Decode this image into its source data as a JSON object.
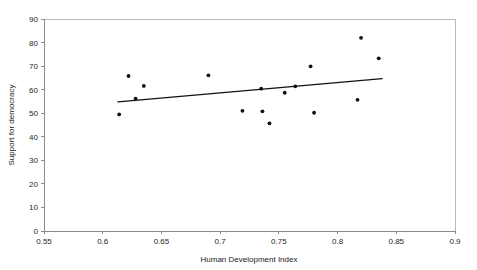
{
  "chart_data": {
    "type": "scatter",
    "title": "",
    "xlabel": "Human Development Index",
    "ylabel": "Support for democracy",
    "xlim": [
      0.55,
      0.9
    ],
    "ylim": [
      0,
      90
    ],
    "xticks": [
      "0.55",
      "0.6",
      "0.65",
      "0.7",
      "0.75",
      "0.8",
      "0.85",
      "0.9"
    ],
    "xtick_values": [
      0.55,
      0.6,
      0.65,
      0.7,
      0.75,
      0.8,
      0.85,
      0.9
    ],
    "yticks": [
      "0",
      "10",
      "20",
      "30",
      "40",
      "50",
      "60",
      "70",
      "80",
      "90"
    ],
    "ytick_values": [
      0,
      10,
      20,
      30,
      40,
      50,
      60,
      70,
      80,
      90
    ],
    "grid": false,
    "legend": "none",
    "marker": "filled-circle",
    "marker_color": "#111111",
    "points": [
      {
        "x": 0.614,
        "y": 49.5
      },
      {
        "x": 0.622,
        "y": 65.8
      },
      {
        "x": 0.628,
        "y": 56.2
      },
      {
        "x": 0.635,
        "y": 61.6
      },
      {
        "x": 0.69,
        "y": 66.1
      },
      {
        "x": 0.719,
        "y": 51.0
      },
      {
        "x": 0.735,
        "y": 60.4
      },
      {
        "x": 0.736,
        "y": 50.8
      },
      {
        "x": 0.742,
        "y": 45.7
      },
      {
        "x": 0.755,
        "y": 58.7
      },
      {
        "x": 0.764,
        "y": 61.4
      },
      {
        "x": 0.777,
        "y": 69.9
      },
      {
        "x": 0.78,
        "y": 50.2
      },
      {
        "x": 0.817,
        "y": 55.7
      },
      {
        "x": 0.82,
        "y": 82.0
      },
      {
        "x": 0.835,
        "y": 73.3
      }
    ],
    "trend_line": {
      "type": "linear-fit",
      "color": "#111111",
      "x_start": 0.613,
      "y_start": 54.8,
      "x_end": 0.838,
      "y_end": 64.7
    }
  }
}
